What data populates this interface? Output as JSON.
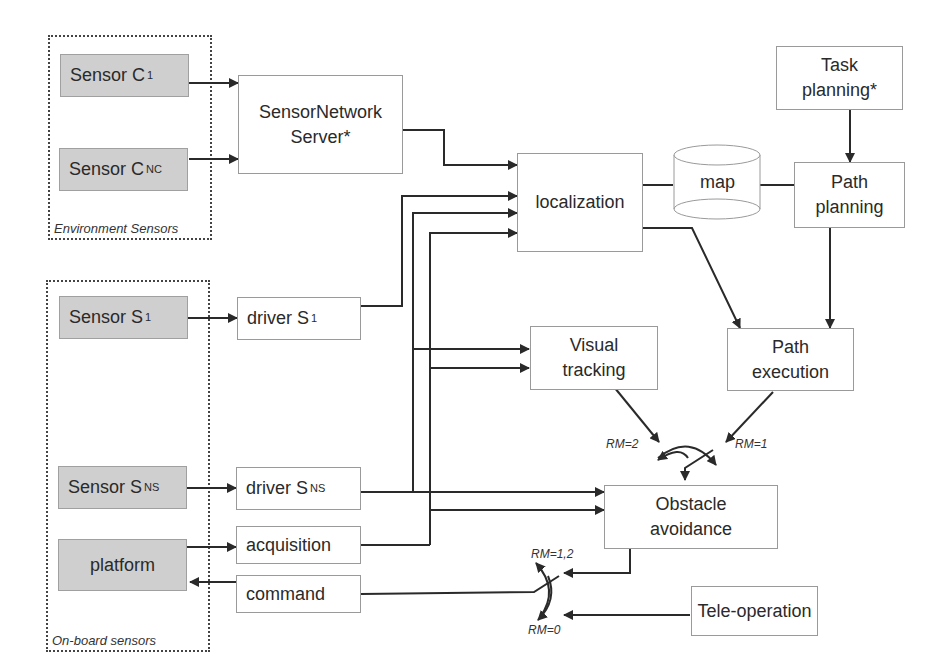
{
  "groups": {
    "environment": {
      "label": "Environment Sensors"
    },
    "onboard": {
      "label": "On-board sensors"
    }
  },
  "nodes": {
    "sensor_c1": {
      "label": "Sensor C",
      "sub": "1"
    },
    "sensor_cnc": {
      "label": "Sensor C",
      "sub": "NC"
    },
    "sensor_network_server": {
      "line1": "SensorNetwork",
      "line2": "Server*"
    },
    "localization": {
      "label": "localization"
    },
    "map": {
      "label": "map"
    },
    "task_planning": {
      "line1": "Task",
      "line2": "planning*"
    },
    "path_planning": {
      "line1": "Path",
      "line2": "planning"
    },
    "sensor_s1": {
      "label": "Sensor S",
      "sub": "1"
    },
    "driver_s1": {
      "label": "driver S",
      "sub": "1"
    },
    "visual_tracking": {
      "line1": "Visual",
      "line2": "tracking"
    },
    "path_execution": {
      "line1": "Path",
      "line2": "execution"
    },
    "sensor_sns": {
      "label": "Sensor S",
      "sub": "NS"
    },
    "driver_sns": {
      "label": "driver S",
      "sub": "NS"
    },
    "platform": {
      "label": "platform"
    },
    "acquisition": {
      "label": "acquisition"
    },
    "command": {
      "label": "command"
    },
    "obstacle_avoidance": {
      "line1": "Obstacle",
      "line2": "avoidance"
    },
    "tele_operation": {
      "label": "Tele-operation"
    }
  },
  "switch_labels": {
    "rm2": "RM=2",
    "rm1": "RM=1",
    "rm12": "RM=1,2",
    "rm0": "RM=0"
  },
  "colors": {
    "sensor_fill": "#cfcfcf",
    "line": "#2a2a2a",
    "box_border": "#9a9a9a"
  }
}
